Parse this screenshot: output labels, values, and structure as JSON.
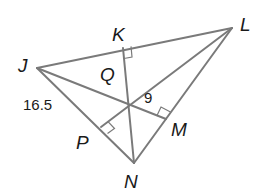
{
  "diagram": {
    "type": "triangle-altitudes",
    "points": {
      "J": {
        "label": "J",
        "x": 37,
        "y": 68
      },
      "K": {
        "label": "K",
        "x": 123,
        "y": 48
      },
      "L": {
        "label": "L",
        "x": 232,
        "y": 28
      },
      "M": {
        "label": "M",
        "x": 166,
        "y": 119
      },
      "N": {
        "label": "N",
        "x": 134,
        "y": 163
      },
      "P": {
        "label": "P",
        "x": 101,
        "y": 127
      },
      "Q": {
        "label": "Q",
        "x": 128,
        "y": 93
      }
    },
    "measurements": {
      "JP": "16.5",
      "QM": "9"
    },
    "line_color": "#7a7a7a",
    "text_color": "#1a1a1a"
  }
}
